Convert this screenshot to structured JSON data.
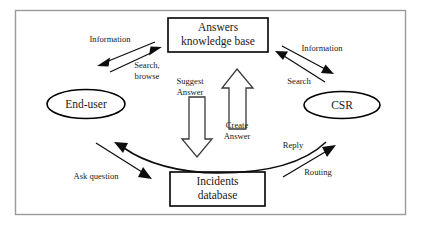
{
  "figure": {
    "type": "flow-diagram",
    "background_color": "#ffffff",
    "frame_color": "#9a9a9a",
    "line_color": "#0d0d0d"
  },
  "nodes": {
    "knowledge_base": {
      "shape": "rectangle",
      "line1": "Answers",
      "line2": "knowledge base"
    },
    "end_user": {
      "shape": "ellipse",
      "label": "End-user"
    },
    "csr": {
      "shape": "ellipse",
      "label": "CSR"
    },
    "incidents_db": {
      "shape": "rectangle",
      "line1": "Incidents",
      "line2": "database"
    }
  },
  "edge_labels": {
    "information_left": "Information",
    "search_browse_line1": "Search,",
    "search_browse_line2": "browse",
    "information_right": "Information",
    "search_right": "Search",
    "suggest_line1": "Suggest",
    "suggest_line2": "Answer",
    "create_line1": "Create",
    "create_line2": "Answer",
    "ask_question": "Ask question",
    "reply": "Reply",
    "routing": "Routing"
  },
  "edges": [
    {
      "from": "knowledge_base",
      "to": "end_user",
      "label": "Information",
      "style": "solid-arrow"
    },
    {
      "from": "end_user",
      "to": "knowledge_base",
      "label": "Search, browse",
      "style": "solid-arrow"
    },
    {
      "from": "knowledge_base",
      "to": "csr",
      "label": "Information",
      "style": "solid-arrow"
    },
    {
      "from": "csr",
      "to": "knowledge_base",
      "label": "Search",
      "style": "solid-arrow"
    },
    {
      "from": "knowledge_base",
      "to": "incidents_db",
      "label": "Suggest Answer",
      "style": "block-arrow-down"
    },
    {
      "from": "incidents_db",
      "to": "knowledge_base",
      "label": "Create Answer",
      "style": "block-arrow-up"
    },
    {
      "from": "end_user",
      "to": "incidents_db",
      "label": "Ask question",
      "style": "solid-arrow"
    },
    {
      "from": "incidents_db",
      "to": "csr",
      "label": "Routing",
      "style": "solid-arrow"
    },
    {
      "from": "csr",
      "to": "end_user",
      "label": "Reply",
      "style": "curved-arrow"
    }
  ]
}
